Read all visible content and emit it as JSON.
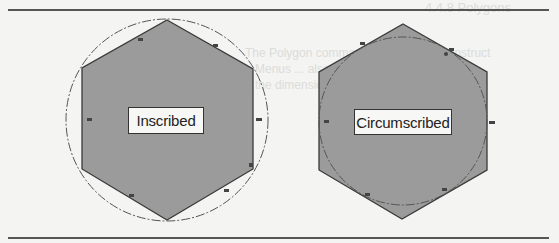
{
  "figure": {
    "colors": {
      "background": "#f4f4f2",
      "polygon_fill": "#9b9b9b",
      "polygon_stroke": "#3a3a3a",
      "circle_stroke": "#555555",
      "rule": "#555555"
    },
    "panels": [
      {
        "id": "inscribed",
        "label": "Inscribed",
        "shape": "hexagon",
        "relationship": "polygon inscribed in circle",
        "vertices": [
          [
            167,
            20
          ],
          [
            253,
            69
          ],
          [
            253,
            169
          ],
          [
            167,
            220
          ],
          [
            82,
            169
          ],
          [
            82,
            68
          ]
        ],
        "circle": {
          "cx": 167,
          "cy": 120,
          "r": 101
        },
        "label_box": {
          "x": 128,
          "y": 107,
          "w": 76,
          "h": 27
        }
      },
      {
        "id": "circumscribed",
        "label": "Circumscribed",
        "shape": "hexagon",
        "relationship": "polygon circumscribed about circle",
        "vertices": [
          [
            403,
            24
          ],
          [
            487,
            72
          ],
          [
            487,
            170
          ],
          [
            402,
            219
          ],
          [
            319,
            170
          ],
          [
            319,
            72
          ]
        ],
        "circle": {
          "cx": 403,
          "cy": 121,
          "r": 84
        },
        "label_box": {
          "x": 354,
          "y": 109,
          "w": 98,
          "h": 26
        }
      }
    ],
    "bleed_through_text": {
      "heading": "4.4.8 Polygons",
      "line1": "The Polygon command is located ... Construct",
      "line2": "Menus ... also ... series",
      "line3": "the dimensions ... polygon ..."
    }
  }
}
